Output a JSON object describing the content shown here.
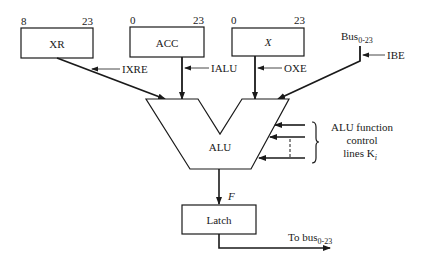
{
  "diagram": {
    "registers": [
      {
        "id": "xr",
        "label": "XR",
        "bit_low": "8",
        "bit_high": "23",
        "control": "IXRE"
      },
      {
        "id": "acc",
        "label": "ACC",
        "bit_low": "0",
        "bit_high": "23",
        "control": "IALU"
      },
      {
        "id": "x",
        "label": "X",
        "bit_low": "0",
        "bit_high": "23",
        "control": "OXE"
      }
    ],
    "bus_input": {
      "label": "Bus",
      "subscript": "0-23",
      "control": "IBE"
    },
    "alu": {
      "label": "ALU"
    },
    "function_control": {
      "line1": "ALU function",
      "line2": "control",
      "line3": "lines K",
      "subscript": "i"
    },
    "alu_output": {
      "label": "F"
    },
    "latch": {
      "label": "Latch"
    },
    "output": {
      "label": "To bus",
      "subscript": "0-23"
    },
    "colors": {
      "line": "#1a1a1a",
      "background": "#ffffff"
    }
  }
}
